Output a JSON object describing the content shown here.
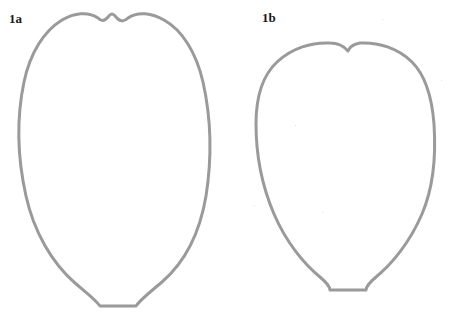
{
  "figure": {
    "background_color": "#ffffff",
    "stroke_color": "#9a9a9a",
    "stroke_width": 3,
    "label_color": "#1a1a1a",
    "width": 455,
    "height": 319,
    "panels": [
      {
        "id": "1a",
        "label": "1a",
        "label_x": 9,
        "label_y": 12,
        "shape_name": "ovate-outline-left",
        "bounds": {
          "left": 22,
          "top": 12,
          "right": 210,
          "bottom": 307
        },
        "apex_notch": {
          "x": 108,
          "depth_y": 19,
          "style": "shallow"
        },
        "base": {
          "x1": 100,
          "x2": 136,
          "y": 306,
          "width": 36
        },
        "path": "M 108 17 C 104 22 101 21 98 18 C 88 11 74 13 62 20 C 44 31 30 53 24 82 C 16 120 18 160 26 196 C 34 232 52 263 75 283 C 88 294 96 300 100 306 L 136 306 C 140 300 149 293 162 282 C 185 262 200 232 206 196 C 212 158 211 118 203 82 C 196 52 182 30 164 20 C 152 13 138 11 128 18 C 124 22 120 22 116 17 C 113 13 111 13 108 17 Z"
      },
      {
        "id": "1b",
        "label": "1b",
        "label_x": 262,
        "label_y": 11,
        "shape_name": "cordate-outline-right",
        "bounds": {
          "left": 256,
          "top": 41,
          "right": 436,
          "bottom": 291
        },
        "apex_notch": {
          "x": 348,
          "depth_y": 52,
          "style": "deep-v"
        },
        "base": {
          "x1": 330,
          "x2": 366,
          "y": 290,
          "width": 36
        },
        "path": "M 348 51 C 343 45 338 43 330 43 C 312 42 292 48 277 62 C 262 76 256 98 256 124 C 256 154 262 186 274 214 C 286 242 304 264 320 277 C 327 283 330 287 330 290 L 366 290 C 366 287 369 283 376 277 C 392 264 410 242 422 214 C 434 186 436 154 434 124 C 432 98 426 76 412 62 C 398 48 378 42 360 43 C 354 44 350 46 348 51 Z"
      }
    ],
    "specks": [
      {
        "x": 382,
        "y": 19
      },
      {
        "x": 295,
        "y": 125
      },
      {
        "x": 254,
        "y": 205
      },
      {
        "x": 441,
        "y": 80
      },
      {
        "x": 322,
        "y": 212
      }
    ]
  }
}
